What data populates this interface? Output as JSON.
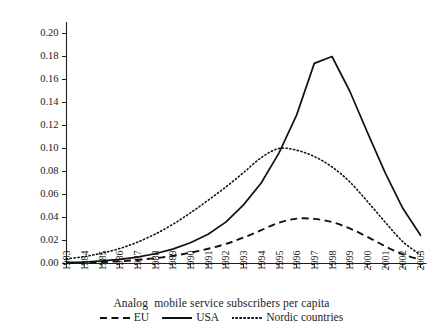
{
  "chart_data": {
    "type": "line",
    "title": "Analog  mobile service subscribers per capita",
    "xlabel": "",
    "ylabel": "",
    "grid": false,
    "legend_position": "bottom",
    "x": [
      1983,
      1984,
      1985,
      1986,
      1987,
      1988,
      1989,
      1990,
      1991,
      1992,
      1993,
      1994,
      1995,
      1996,
      1997,
      1998,
      1999,
      2000,
      2001,
      2002,
      2003
    ],
    "xlim": [
      1983,
      2003
    ],
    "ylim": [
      0.0,
      0.21
    ],
    "ytick_labels": [
      "0.00",
      "0.02",
      "0.04",
      "0.06",
      "0.08",
      "0.10",
      "0.12",
      "0.14",
      "0.16",
      "0.18",
      "0.20"
    ],
    "ytick_values": [
      0.0,
      0.02,
      0.04,
      0.06,
      0.08,
      0.1,
      0.12,
      0.14,
      0.16,
      0.18,
      0.2
    ],
    "xtick_labels": [
      "1983",
      "1984",
      "1985",
      "1986",
      "1987",
      "1988",
      "1989",
      "1990",
      "1991",
      "1992",
      "1993",
      "1994",
      "1995",
      "1996",
      "1997",
      "1998",
      "1999",
      "2000",
      "2001",
      "2002",
      "2003"
    ],
    "series": [
      {
        "name": "EU",
        "style": "dashed",
        "color": "#111111",
        "values": [
          0.0005,
          0.0008,
          0.0013,
          0.002,
          0.0031,
          0.0046,
          0.0066,
          0.0094,
          0.0128,
          0.017,
          0.0225,
          0.029,
          0.0355,
          0.039,
          0.0388,
          0.036,
          0.0305,
          0.0232,
          0.015,
          0.008,
          0.0032
        ]
      },
      {
        "name": "USA",
        "style": "solid",
        "color": "#111111",
        "values": [
          0.0008,
          0.0013,
          0.0022,
          0.0036,
          0.0056,
          0.0085,
          0.0125,
          0.018,
          0.0255,
          0.036,
          0.051,
          0.07,
          0.096,
          0.129,
          0.174,
          0.18,
          0.15,
          0.114,
          0.079,
          0.048,
          0.0245
        ]
      },
      {
        "name": "Nordic countries",
        "style": "dotted",
        "color": "#111111",
        "values": [
          0.004,
          0.006,
          0.009,
          0.013,
          0.0185,
          0.0255,
          0.034,
          0.044,
          0.055,
          0.0665,
          0.079,
          0.092,
          0.1,
          0.0985,
          0.093,
          0.084,
          0.071,
          0.054,
          0.036,
          0.019,
          0.0075
        ]
      }
    ]
  },
  "legend": {
    "items": [
      {
        "label": "EU",
        "style": "dashed"
      },
      {
        "label": "USA",
        "style": "solid"
      },
      {
        "label": "Nordic countries",
        "style": "dotted"
      }
    ]
  }
}
